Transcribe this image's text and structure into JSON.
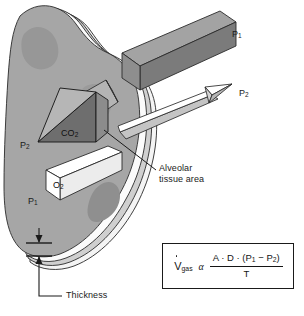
{
  "figure": {
    "background_color": "#ffffff"
  },
  "labels": {
    "p1_top_right": "P",
    "p1_top_right_sub": "1",
    "p2_right": "P",
    "p2_right_sub": "2",
    "p2_left": "P",
    "p2_left_sub": "2",
    "p1_left": "P",
    "p1_left_sub": "1",
    "co2": "CO",
    "co2_sub": "2",
    "o2": "O",
    "o2_sub": "2",
    "alveolar_line1": "Alveolar",
    "alveolar_line2": "tissue area",
    "thickness": "Thickness"
  },
  "formula": {
    "symbol": "V",
    "symbol_sub": "gas",
    "relation": "α",
    "numerator_prefix": "A · D · (P",
    "numerator_sub1": "1",
    "numerator_middle": " − P",
    "numerator_sub2": "2",
    "numerator_suffix": ")",
    "denominator": "T"
  },
  "colors": {
    "alveolus_body": "#a8a8a8",
    "alveolus_patch": "#9a9a9a",
    "membrane_light": "#e8e8e8",
    "membrane_mid": "#c9c9c9",
    "membrane_pale": "#f2f2f2",
    "bar_p1_top": "#9e9e9e",
    "bar_p1_front": "#8a8a8a",
    "bar_p1_side": "#6f6f6f",
    "co2_dark": "#6e6e6e",
    "co2_mid": "#8f8f8f",
    "co2_light": "#b8b8b8",
    "o2_white": "#ffffff",
    "o2_shade": "#d6d6d6",
    "arrow_white": "#ffffff",
    "arrow_shade": "#c4c4c4",
    "stroke": "#1a1a1a",
    "text": "#1a1a1a"
  }
}
